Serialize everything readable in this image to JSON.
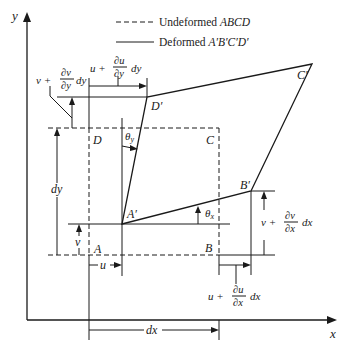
{
  "legend": {
    "undeformed_label": "Undeformed",
    "undeformed_name": "ABCD",
    "deformed_label": "Deformed",
    "deformed_name": "A′B′C′D′"
  },
  "axes": {
    "x_label": "x",
    "y_label": "y"
  },
  "points": {
    "A": "A",
    "B": "B",
    "C": "C",
    "D": "D",
    "A_prime": "A′",
    "B_prime": "B′",
    "C_prime": "C′",
    "D_prime": "D′"
  },
  "angles": {
    "theta_x": "θ",
    "theta_x_sub": "x",
    "theta_y": "θ",
    "theta_y_sub": "y"
  },
  "dimensions": {
    "u": "u",
    "v": "v",
    "dx": "dx",
    "dy": "dy",
    "u_plus_du_dy": {
      "base": "u +",
      "num": "∂u",
      "den": "∂y",
      "tail": "dy"
    },
    "v_plus_dv_dy": {
      "base": "v +",
      "num": "∂v",
      "den": "∂y",
      "tail": "dy"
    },
    "v_plus_dv_dx": {
      "base": "v +",
      "num": "∂v",
      "den": "∂x",
      "tail": "dx"
    },
    "u_plus_du_dx": {
      "base": "u +",
      "num": "∂u",
      "den": "∂x",
      "tail": "dx"
    }
  },
  "colors": {
    "ink": "#1a1a1a",
    "background": "#ffffff"
  }
}
